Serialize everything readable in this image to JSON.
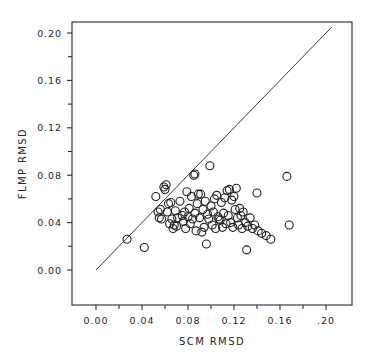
{
  "chart_data": {
    "type": "scatter",
    "title": "",
    "xlabel": "SCM RMSD",
    "ylabel": "FLMP RMSD",
    "xlim": [
      0.0,
      0.21
    ],
    "ylim": [
      0.0,
      0.21
    ],
    "grid": false,
    "legend": null,
    "x_tick_labels": [
      "0.00",
      "0.04",
      "0.08",
      "0.12",
      "0.16",
      ".20"
    ],
    "x_tick_values": [
      0.0,
      0.04,
      0.08,
      0.12,
      0.16,
      0.2
    ],
    "y_tick_labels": [
      "0.00",
      "0.04",
      "0.08",
      "0.12",
      "0.16",
      "0.20"
    ],
    "y_tick_values": [
      0.0,
      0.04,
      0.08,
      0.12,
      0.16,
      0.2
    ],
    "minor_tick_interval": 0.02,
    "marker": "open-circle",
    "marker_radius_px": 4.0,
    "reference_line": {
      "name": "identity-line",
      "x": [
        0.0,
        0.205
      ],
      "y": [
        0.0,
        0.205
      ]
    },
    "series": [
      {
        "name": "models",
        "points": [
          [
            0.027,
            0.026
          ],
          [
            0.042,
            0.019
          ],
          [
            0.052,
            0.062
          ],
          [
            0.054,
            0.049
          ],
          [
            0.055,
            0.044
          ],
          [
            0.056,
            0.051
          ],
          [
            0.057,
            0.043
          ],
          [
            0.059,
            0.07
          ],
          [
            0.06,
            0.068
          ],
          [
            0.061,
            0.072
          ],
          [
            0.062,
            0.049
          ],
          [
            0.063,
            0.056
          ],
          [
            0.064,
            0.039
          ],
          [
            0.065,
            0.057
          ],
          [
            0.066,
            0.043
          ],
          [
            0.067,
            0.035
          ],
          [
            0.068,
            0.038
          ],
          [
            0.069,
            0.05
          ],
          [
            0.07,
            0.037
          ],
          [
            0.071,
            0.044
          ],
          [
            0.073,
            0.058
          ],
          [
            0.075,
            0.046
          ],
          [
            0.076,
            0.041
          ],
          [
            0.077,
            0.049
          ],
          [
            0.078,
            0.035
          ],
          [
            0.079,
            0.066
          ],
          [
            0.08,
            0.045
          ],
          [
            0.081,
            0.052
          ],
          [
            0.082,
            0.039
          ],
          [
            0.083,
            0.062
          ],
          [
            0.084,
            0.043
          ],
          [
            0.085,
            0.08
          ],
          [
            0.086,
            0.081
          ],
          [
            0.086,
            0.048
          ],
          [
            0.087,
            0.033
          ],
          [
            0.088,
            0.056
          ],
          [
            0.089,
            0.064
          ],
          [
            0.09,
            0.044
          ],
          [
            0.091,
            0.064
          ],
          [
            0.092,
            0.032
          ],
          [
            0.093,
            0.051
          ],
          [
            0.094,
            0.036
          ],
          [
            0.095,
            0.058
          ],
          [
            0.096,
            0.022
          ],
          [
            0.097,
            0.047
          ],
          [
            0.098,
            0.043
          ],
          [
            0.099,
            0.088
          ],
          [
            0.1,
            0.054
          ],
          [
            0.101,
            0.038
          ],
          [
            0.102,
            0.049
          ],
          [
            0.103,
            0.06
          ],
          [
            0.104,
            0.035
          ],
          [
            0.105,
            0.063
          ],
          [
            0.106,
            0.045
          ],
          [
            0.107,
            0.043
          ],
          [
            0.108,
            0.042
          ],
          [
            0.109,
            0.057
          ],
          [
            0.11,
            0.036
          ],
          [
            0.111,
            0.048
          ],
          [
            0.112,
            0.061
          ],
          [
            0.113,
            0.039
          ],
          [
            0.114,
            0.067
          ],
          [
            0.115,
            0.046
          ],
          [
            0.116,
            0.068
          ],
          [
            0.117,
            0.04
          ],
          [
            0.118,
            0.059
          ],
          [
            0.119,
            0.036
          ],
          [
            0.12,
            0.062
          ],
          [
            0.121,
            0.051
          ],
          [
            0.122,
            0.069
          ],
          [
            0.123,
            0.044
          ],
          [
            0.124,
            0.038
          ],
          [
            0.125,
            0.052
          ],
          [
            0.126,
            0.046
          ],
          [
            0.127,
            0.035
          ],
          [
            0.128,
            0.049
          ],
          [
            0.13,
            0.04
          ],
          [
            0.131,
            0.017
          ],
          [
            0.132,
            0.037
          ],
          [
            0.134,
            0.044
          ],
          [
            0.136,
            0.035
          ],
          [
            0.138,
            0.038
          ],
          [
            0.14,
            0.065
          ],
          [
            0.141,
            0.033
          ],
          [
            0.144,
            0.031
          ],
          [
            0.148,
            0.029
          ],
          [
            0.152,
            0.026
          ],
          [
            0.166,
            0.079
          ],
          [
            0.168,
            0.038
          ]
        ]
      }
    ]
  },
  "axes": {
    "x_title": "SCM RMSD",
    "y_title": "FLMP RMSD"
  }
}
